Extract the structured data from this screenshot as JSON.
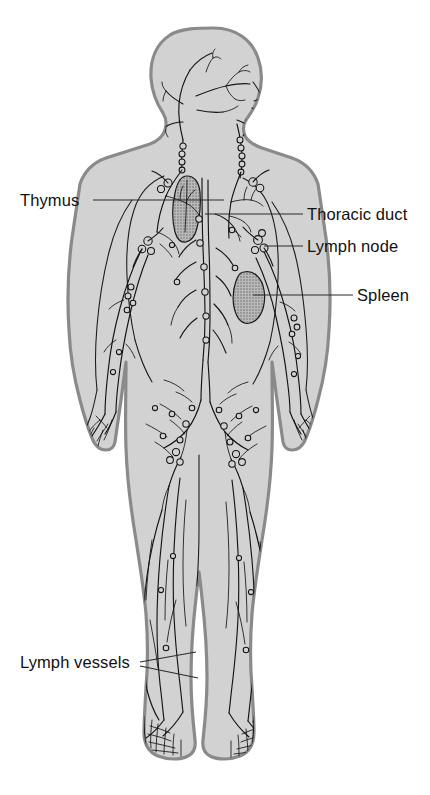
{
  "diagram": {
    "background_color": "#ffffff",
    "body_fill_color": "#d2d2d2",
    "body_outline_color": "#8a8a8a",
    "vessel_color": "#141414",
    "organ_fill_color": "#a8a8a8",
    "label_color": "#111111"
  },
  "labels": [
    {
      "id": "thymus",
      "text": "Thymus",
      "side": "left",
      "text_x": 20,
      "text_y": 206,
      "leader": "M 93 200 L 224 200",
      "target": "thymus-organ"
    },
    {
      "id": "thoracic-duct",
      "text": "Thoracic duct",
      "side": "right",
      "text_x": 307,
      "text_y": 220,
      "leader": "M 205 214 L 303 214",
      "target": "thoracic-duct-vessel"
    },
    {
      "id": "lymph-node",
      "text": "Lymph node",
      "side": "right",
      "text_x": 307,
      "text_y": 252,
      "leader": "M 264 246 L 303 246",
      "target": "axillary-lymph-node"
    },
    {
      "id": "spleen",
      "text": "Spleen",
      "side": "right",
      "text_x": 357,
      "text_y": 301,
      "leader": "M 253 295 L 353 295",
      "target": "spleen-organ"
    },
    {
      "id": "lymph-vessels",
      "text": "Lymph vessels",
      "side": "left",
      "text_x": 20,
      "text_y": 668,
      "leader_a": "M 140 662 L 196 652",
      "leader_b": "M 140 666 L 198 678",
      "target": "leg-lymph-vessels"
    }
  ],
  "anatomy": {
    "regions": [
      "head-profile",
      "neck",
      "thorax",
      "abdomen",
      "pelvis",
      "arms",
      "hands",
      "legs",
      "feet"
    ],
    "organs": [
      {
        "name": "thymus",
        "location": "upper-mediastinum"
      },
      {
        "name": "spleen",
        "location": "left-upper-abdomen"
      }
    ],
    "structures": [
      {
        "name": "thoracic-duct",
        "location": "central-chest"
      },
      {
        "name": "cervical-lymph-nodes",
        "location": "neck"
      },
      {
        "name": "axillary-lymph-nodes",
        "location": "armpit"
      },
      {
        "name": "inguinal-lymph-nodes",
        "location": "groin"
      },
      {
        "name": "popliteal-lymph-nodes",
        "location": "behind-knee"
      },
      {
        "name": "plantar-lymph-plexus",
        "location": "feet"
      },
      {
        "name": "palmar-lymph-plexus",
        "location": "hands"
      }
    ]
  }
}
